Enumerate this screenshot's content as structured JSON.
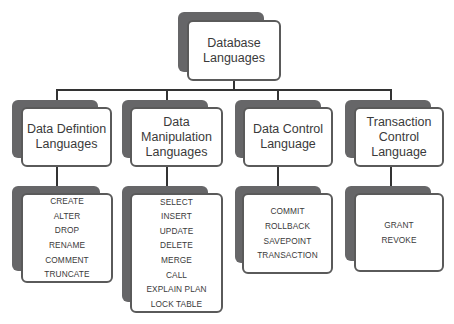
{
  "diagram": {
    "root": {
      "line1": "Database",
      "line2": "Languages"
    },
    "categories": [
      {
        "title_lines": [
          "Data Defintion",
          "Languages"
        ],
        "commands": [
          "CREATE",
          "ALTER",
          "DROP",
          "RENAME",
          "COMMENT",
          "TRUNCATE"
        ]
      },
      {
        "title_lines": [
          "Data",
          "Manipulation",
          "Languages"
        ],
        "commands": [
          "SELECT",
          "INSERT",
          "UPDATE",
          "DELETE",
          "MERGE",
          "CALL",
          "EXPLAIN PLAN",
          "LOCK TABLE"
        ]
      },
      {
        "title_lines": [
          "Data Control",
          "Language"
        ],
        "commands": [
          "COMMIT",
          "ROLLBACK",
          "SAVEPOINT",
          "TRANSACTION"
        ]
      },
      {
        "title_lines": [
          "Transaction",
          "Control",
          "Language"
        ],
        "commands": [
          "GRANT",
          "REVOKE"
        ]
      }
    ]
  }
}
